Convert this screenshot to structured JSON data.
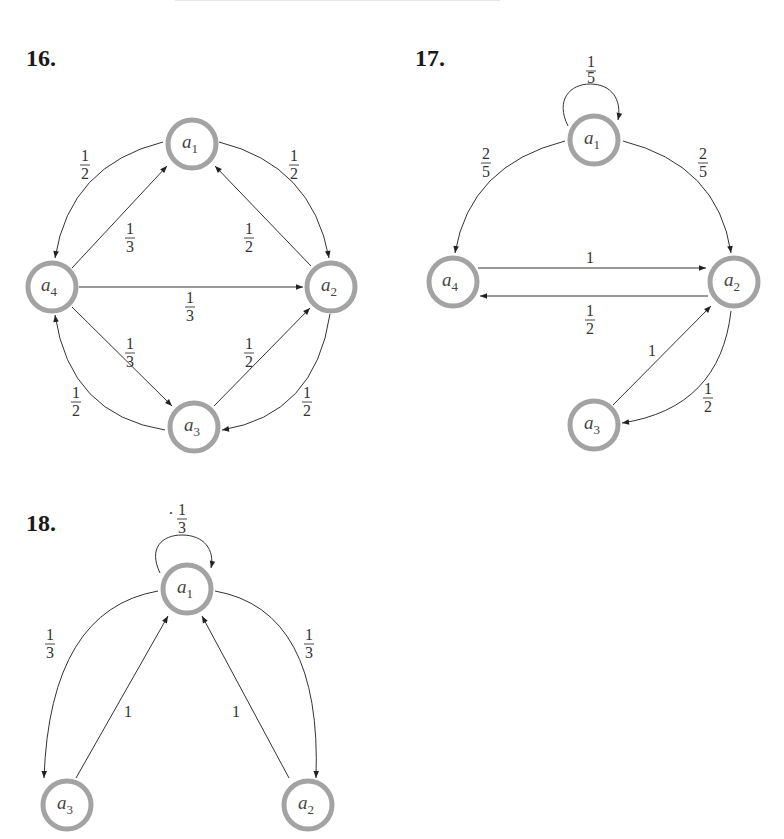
{
  "problems": [
    {
      "number": "16.",
      "nodes": [
        {
          "id": "a1",
          "name": "a",
          "sub": "1",
          "x": 192,
          "y": 144
        },
        {
          "id": "a2",
          "name": "a",
          "sub": "2",
          "x": 331,
          "y": 287
        },
        {
          "id": "a3",
          "name": "a",
          "sub": "3",
          "x": 194,
          "y": 427
        },
        {
          "id": "a4",
          "name": "a",
          "sub": "4",
          "x": 52,
          "y": 287
        }
      ],
      "edges": [
        {
          "from": "a1",
          "to": "a4",
          "weight": {
            "num": "1",
            "den": "2"
          }
        },
        {
          "from": "a1",
          "to": "a2",
          "weight": {
            "num": "1",
            "den": "2"
          }
        },
        {
          "from": "a4",
          "to": "a1",
          "weight": {
            "num": "1",
            "den": "3"
          }
        },
        {
          "from": "a2",
          "to": "a1",
          "weight": {
            "num": "1",
            "den": "2"
          }
        },
        {
          "from": "a4",
          "to": "a2",
          "weight": {
            "num": "1",
            "den": "3"
          }
        },
        {
          "from": "a4",
          "to": "a3",
          "weight": {
            "num": "1",
            "den": "3"
          }
        },
        {
          "from": "a3",
          "to": "a2",
          "weight": {
            "num": "1",
            "den": "2"
          }
        },
        {
          "from": "a3",
          "to": "a4",
          "weight": {
            "num": "1",
            "den": "2"
          }
        },
        {
          "from": "a2",
          "to": "a3",
          "weight": {
            "num": "1",
            "den": "2"
          }
        }
      ]
    },
    {
      "number": "17.",
      "nodes": [
        {
          "id": "a1",
          "name": "a",
          "sub": "1",
          "x": 594,
          "y": 140
        },
        {
          "id": "a2",
          "name": "a",
          "sub": "2",
          "x": 734,
          "y": 282
        },
        {
          "id": "a3",
          "name": "a",
          "sub": "3",
          "x": 594,
          "y": 425
        },
        {
          "id": "a4",
          "name": "a",
          "sub": "4",
          "x": 453,
          "y": 282
        }
      ],
      "edges": [
        {
          "from": "a1",
          "to": "a1",
          "weight": {
            "num": "1",
            "den": "5"
          }
        },
        {
          "from": "a1",
          "to": "a4",
          "weight": {
            "num": "2",
            "den": "5"
          }
        },
        {
          "from": "a1",
          "to": "a2",
          "weight": {
            "num": "2",
            "den": "5"
          }
        },
        {
          "from": "a4",
          "to": "a2",
          "weight": {
            "num": "1",
            "den": ""
          }
        },
        {
          "from": "a2",
          "to": "a4",
          "weight": {
            "num": "1",
            "den": "2"
          }
        },
        {
          "from": "a3",
          "to": "a2",
          "weight": {
            "num": "1",
            "den": ""
          }
        },
        {
          "from": "a2",
          "to": "a3",
          "weight": {
            "num": "1",
            "den": "2"
          }
        }
      ]
    },
    {
      "number": "18.",
      "nodes": [
        {
          "id": "a1",
          "name": "a",
          "sub": "1",
          "x": 187,
          "y": 589
        },
        {
          "id": "a2",
          "name": "a",
          "sub": "2",
          "x": 308,
          "y": 805
        },
        {
          "id": "a3",
          "name": "a",
          "sub": "3",
          "x": 67,
          "y": 805
        }
      ],
      "edges": [
        {
          "from": "a1",
          "to": "a1",
          "weight": {
            "num": "1",
            "den": "3"
          }
        },
        {
          "from": "a1",
          "to": "a3",
          "weight": {
            "num": "1",
            "den": "3"
          }
        },
        {
          "from": "a1",
          "to": "a2",
          "weight": {
            "num": "1",
            "den": "3"
          }
        },
        {
          "from": "a3",
          "to": "a1",
          "weight": {
            "num": "1",
            "den": ""
          }
        },
        {
          "from": "a2",
          "to": "a1",
          "weight": {
            "num": "1",
            "den": ""
          }
        }
      ]
    }
  ],
  "labels": {
    "p16": "16.",
    "p17": "17.",
    "p18": "18.",
    "a": "a",
    "s1": "1",
    "s2": "2",
    "s3": "3",
    "s4": "4",
    "one": "1",
    "two": "2",
    "three": "3",
    "five": "5",
    "dot": "·"
  }
}
